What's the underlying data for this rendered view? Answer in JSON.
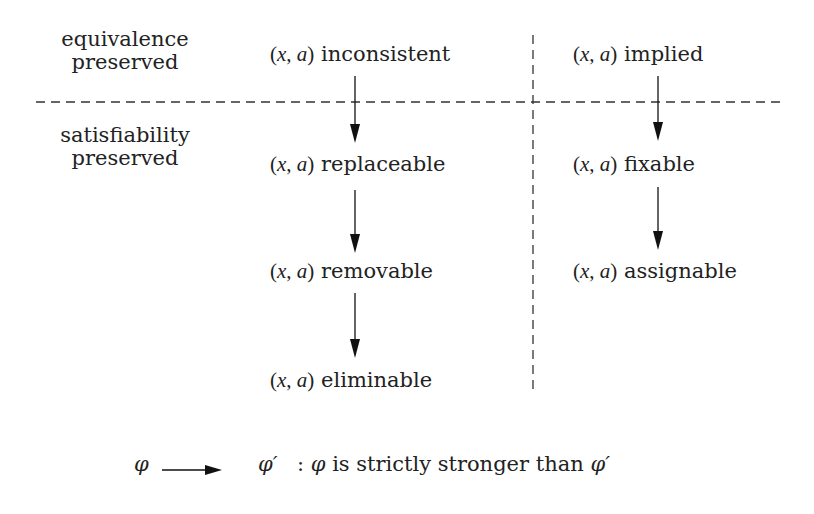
{
  "rows": {
    "top": {
      "line1": "equivalence",
      "line2": "preserved"
    },
    "bottom": {
      "line1": "satisfiability",
      "line2": "preserved"
    }
  },
  "pair": {
    "open": "(",
    "x": "x",
    "comma": ", ",
    "a": "a",
    "close": ")"
  },
  "left_column": [
    {
      "id": "inconsistent",
      "label": "inconsistent"
    },
    {
      "id": "replaceable",
      "label": "replaceable"
    },
    {
      "id": "removable",
      "label": "removable"
    },
    {
      "id": "eliminable",
      "label": "eliminable"
    }
  ],
  "right_column": [
    {
      "id": "implied",
      "label": "implied"
    },
    {
      "id": "fixable",
      "label": "fixable"
    },
    {
      "id": "assignable",
      "label": "assignable"
    }
  ],
  "edges": [
    [
      "inconsistent",
      "replaceable"
    ],
    [
      "replaceable",
      "removable"
    ],
    [
      "removable",
      "eliminable"
    ],
    [
      "implied",
      "fixable"
    ],
    [
      "fixable",
      "assignable"
    ]
  ],
  "legend": {
    "from": "φ",
    "to": "φ′",
    "separator": ":",
    "subject": "φ",
    "text": "is strictly stronger than",
    "object": "φ′"
  }
}
